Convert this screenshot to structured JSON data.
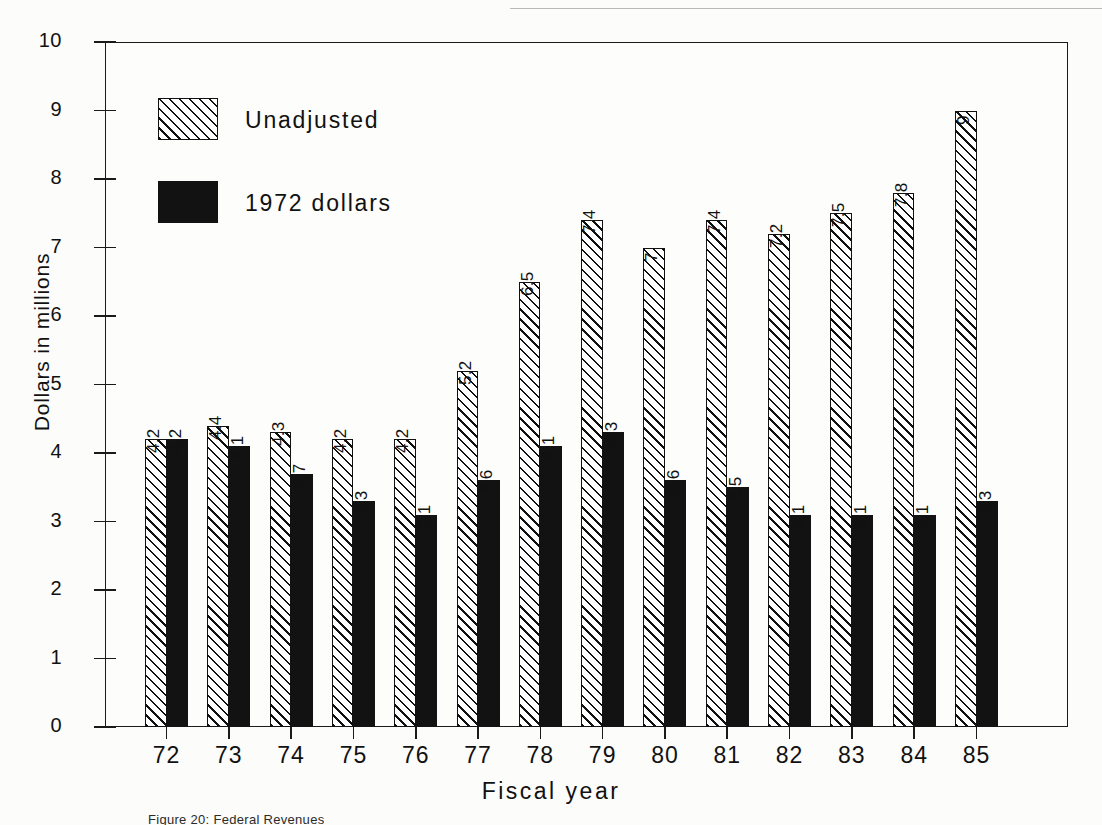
{
  "figure": {
    "caption": "Figure 20:  Federal Revenues"
  },
  "legend": {
    "position": "top-left-inside",
    "entries": [
      {
        "label": "Unadjusted",
        "swatch": "hatched-diagonal"
      },
      {
        "label": "1972 dollars",
        "swatch": "solid-black"
      }
    ]
  },
  "axes": {
    "y_title": "Dollars in millions",
    "x_title": "Fiscal year",
    "y_ticks": [
      "0",
      "1",
      "2",
      "3",
      "4",
      "5",
      "6",
      "7",
      "8",
      "9",
      "10"
    ],
    "y_min": 0,
    "y_max": 10
  },
  "colors": {
    "ink": "#111111",
    "paper": "#fdfdfb",
    "solid_series": "#121212",
    "hatched_series": "#ffffff"
  },
  "chart_data": {
    "type": "bar",
    "title": "",
    "subtitle": "",
    "xlabel": "Fiscal year",
    "ylabel": "Dollars in millions",
    "ylim": [
      0,
      10
    ],
    "grid": false,
    "legend_position": "upper left",
    "categories": [
      "72",
      "73",
      "74",
      "75",
      "76",
      "77",
      "78",
      "79",
      "80",
      "81",
      "82",
      "83",
      "84",
      "85"
    ],
    "series": [
      {
        "name": "Unadjusted",
        "values": [
          4.2,
          4.4,
          4.3,
          4.2,
          4.2,
          5.2,
          6.5,
          7.4,
          7,
          7.4,
          7.2,
          7.5,
          7.8,
          9
        ],
        "labels": [
          "4.2",
          "4.4",
          "4.3",
          "4.2",
          "4.2",
          "5.2",
          "6.5",
          "7.4",
          "7",
          "7.4",
          "7.2",
          "7.5",
          "7.8",
          "9"
        ]
      },
      {
        "name": "1972 dollars",
        "values": [
          4.2,
          4.1,
          3.7,
          3.3,
          3.1,
          3.6,
          4.1,
          4.3,
          3.6,
          3.5,
          3.1,
          3.1,
          3.1,
          3.3
        ],
        "labels": [
          "4.2",
          "4.1",
          "3.7",
          "3.3",
          "3.1",
          "3.6",
          "4.1",
          "4.3",
          "3.6",
          "3.5",
          "3.1",
          "3.1",
          "3.1",
          "3.3"
        ]
      }
    ]
  }
}
